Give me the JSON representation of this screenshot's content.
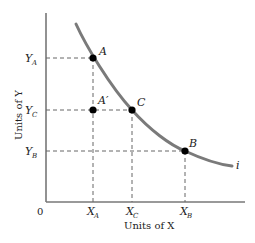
{
  "diagram": {
    "type": "indifference-curve",
    "axes": {
      "x_label": "Units of X",
      "y_label": "Units of Y",
      "origin_label": "0"
    },
    "curve": {
      "label": "i",
      "color": "#7a7a7a"
    },
    "points": [
      {
        "id": "A",
        "label": "A",
        "x_tick": "X_A",
        "y_tick": "Y_A"
      },
      {
        "id": "A_prime",
        "label": "A′"
      },
      {
        "id": "C",
        "label": "C",
        "x_tick": "X_C",
        "y_tick": "Y_C"
      },
      {
        "id": "B",
        "label": "B",
        "x_tick": "X_B",
        "y_tick": "Y_B"
      }
    ],
    "ticks": {
      "x": [
        {
          "main": "X",
          "sub": "A"
        },
        {
          "main": "X",
          "sub": "C"
        },
        {
          "main": "X",
          "sub": "B"
        }
      ],
      "y": [
        {
          "main": "Y",
          "sub": "A"
        },
        {
          "main": "Y",
          "sub": "C"
        },
        {
          "main": "Y",
          "sub": "B"
        }
      ]
    }
  }
}
